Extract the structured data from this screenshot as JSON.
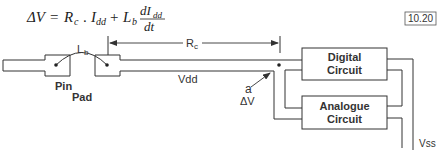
{
  "equation": {
    "lhs": "ΔV",
    "equals": "=",
    "term1_symbol": "R",
    "term1_sub": "c",
    "dot": ".",
    "term2_symbol": "I",
    "term2_sub": "dd",
    "plus": "+",
    "term3_symbol": "L",
    "term3_sub": "b",
    "frac_num_symbol": "dI",
    "frac_num_sub": "dd",
    "frac_den": "dt"
  },
  "figure_ref": "10.20",
  "labels": {
    "lb": "L",
    "lb_sub": "b",
    "rc": "R",
    "rc_sub": "c",
    "vdd": "Vdd",
    "pin": "Pin",
    "pad": "Pad",
    "node_a": "a",
    "delta_v": "ΔV",
    "vss": "Vss"
  },
  "blocks": {
    "digital": {
      "line1": "Digital",
      "line2": "Circuit"
    },
    "analogue": {
      "line1": "Analogue",
      "line2": "Circuit"
    }
  },
  "colors": {
    "stroke": "#333333",
    "background": "#ffffff"
  }
}
